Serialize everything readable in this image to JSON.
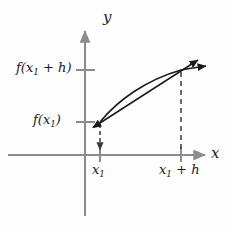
{
  "figure": {
    "background_color": "#fefefe",
    "axis_color": "#8c8c8c",
    "curve_color": "#1a1a1a",
    "secant_color": "#1a1a1a",
    "dashed_color": "#3a3a3a",
    "label_color": "#1a1a1a"
  },
  "axes": {
    "x_label": "x",
    "y_label": "y",
    "origin": {
      "x": 85,
      "y": 155
    },
    "x_axis_start": 8,
    "x_axis_end": 208,
    "y_axis_top": 28,
    "y_axis_bottom": 216
  },
  "y_ticks": [
    {
      "name": "f-x1-plus-h",
      "label_html": "f(x<sub>1</sub> + h)",
      "label_text": "f(x1 + h)",
      "y": 70
    },
    {
      "name": "f-x1",
      "label_html": "f(x<sub>1</sub>)",
      "label_text": "f(x1)",
      "y": 122
    }
  ],
  "x_ticks": [
    {
      "name": "x1",
      "label_html": "x<sub>1</sub>",
      "label_text": "x1",
      "x": 100
    },
    {
      "name": "x1-plus-h",
      "label_html": "x<sub>1</sub> + h",
      "label_text": "x1 + h",
      "x": 181
    }
  ],
  "points": [
    {
      "name": "left-point",
      "x": 100,
      "y": 122,
      "meaning": "(x1, f(x1))"
    },
    {
      "name": "right-point",
      "x": 181,
      "y": 70,
      "meaning": "(x1 + h, f(x1 + h))"
    }
  ],
  "curve": {
    "name": "function-curve",
    "path": "M 100 122 C 118 100, 145 80, 181 70 C 196 67, 203 66, 208 65",
    "description": "Concave-down increasing curve from (x1, f(x1)) through (x1+h, f(x1+h)), continuing right with an arrowhead"
  },
  "secant": {
    "name": "secant-line",
    "x1": 92,
    "y1": 128,
    "x2": 199,
    "y2": 59,
    "description": "Double-headed secant line through both points, extended beyond each end"
  },
  "dashed_lines": [
    {
      "name": "dashed-drop-x1",
      "x": 100,
      "y_top": 126,
      "y_bottom": 155
    },
    {
      "name": "dashed-drop-x1-plus-h",
      "x": 181,
      "y_top": 72,
      "y_bottom": 153
    }
  ]
}
